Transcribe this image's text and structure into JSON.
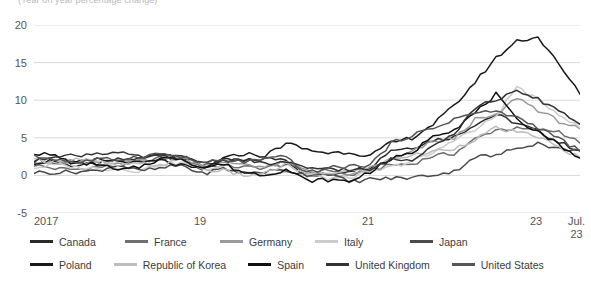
{
  "subtitle": "(Year on year percentage change)",
  "axes": {
    "yticks": [
      20,
      15,
      10,
      5,
      0,
      -5
    ],
    "ylim": [
      -5,
      20
    ],
    "xticks": [
      "2017",
      "19",
      "21",
      "23"
    ],
    "xtick_last_line1": "Jul.",
    "xtick_last_line2": "23"
  },
  "colors": {
    "canada": "#2b2b2b",
    "france": "#6e6e6e",
    "germany": "#9a9a9a",
    "italy": "#cccccc",
    "japan": "#4a4a4a",
    "poland": "#1a1a1a",
    "korea": "#bdbdbd",
    "spain": "#111111",
    "uk": "#333333",
    "us": "#555555",
    "gridline": "#d9d9d9",
    "text": "#3a3a3a",
    "subtitle": "#b9b9b9"
  },
  "chart_data": {
    "type": "line",
    "title": "",
    "subtitle": "(Year on year percentage change)",
    "xlabel": "",
    "ylabel": "",
    "ylim": [
      -5,
      20
    ],
    "grid": true,
    "legend_position": "bottom",
    "x": [
      "2017",
      "2017-04",
      "2017-07",
      "2017-10",
      "2018",
      "2018-04",
      "2018-07",
      "2018-10",
      "2019",
      "2019-04",
      "2019-07",
      "2019-10",
      "2020",
      "2020-04",
      "2020-07",
      "2020-10",
      "2021",
      "2021-04",
      "2021-07",
      "2021-10",
      "2022",
      "2022-04",
      "2022-07",
      "2022-10",
      "2023",
      "2023-04",
      "2023-07"
    ],
    "series": [
      {
        "name": "Canada",
        "color": "#2b2b2b",
        "values": [
          2.1,
          1.6,
          1.3,
          1.5,
          2.1,
          2.2,
          3.0,
          2.4,
          1.4,
          2.0,
          1.9,
          2.2,
          2.2,
          -0.2,
          0.1,
          0.7,
          1.1,
          3.4,
          3.7,
          4.7,
          5.1,
          6.8,
          8.1,
          6.9,
          5.9,
          4.4,
          3.3
        ]
      },
      {
        "name": "France",
        "color": "#6e6e6e",
        "values": [
          1.4,
          0.9,
          0.8,
          1.1,
          1.3,
          1.8,
          2.3,
          2.2,
          1.2,
          1.3,
          1.1,
          1.0,
          1.5,
          0.3,
          0.8,
          0.0,
          0.6,
          1.4,
          1.5,
          2.6,
          2.9,
          4.8,
          6.1,
          6.2,
          6.0,
          5.9,
          4.3
        ]
      },
      {
        "name": "Germany",
        "color": "#9a9a9a",
        "values": [
          1.9,
          1.7,
          1.6,
          1.6,
          1.4,
          2.1,
          2.1,
          2.3,
          1.5,
          1.6,
          1.6,
          1.1,
          1.7,
          0.8,
          0.0,
          -0.2,
          1.0,
          2.0,
          3.1,
          4.5,
          4.9,
          7.4,
          7.9,
          10.4,
          8.7,
          7.2,
          6.2
        ]
      },
      {
        "name": "Italy",
        "color": "#cccccc",
        "values": [
          1.0,
          1.4,
          1.1,
          0.9,
          0.9,
          0.6,
          1.5,
          1.6,
          0.9,
          1.0,
          0.4,
          0.2,
          0.5,
          0.0,
          -0.4,
          -0.3,
          0.4,
          1.1,
          1.9,
          2.9,
          4.8,
          6.0,
          7.9,
          11.8,
          10.0,
          8.2,
          6.3
        ]
      },
      {
        "name": "Japan",
        "color": "#4a4a4a",
        "values": [
          0.4,
          0.4,
          0.5,
          0.6,
          1.4,
          0.6,
          0.9,
          1.4,
          0.2,
          0.9,
          0.3,
          0.5,
          0.7,
          0.1,
          0.3,
          -0.9,
          -0.5,
          -0.4,
          -0.3,
          0.1,
          0.5,
          2.5,
          2.6,
          3.7,
          4.3,
          3.5,
          3.3
        ]
      },
      {
        "name": "Poland",
        "color": "#1a1a1a",
        "values": [
          1.7,
          2.0,
          1.7,
          2.1,
          1.9,
          1.6,
          2.0,
          1.3,
          0.7,
          2.2,
          2.9,
          2.6,
          4.3,
          3.4,
          3.0,
          3.1,
          2.6,
          4.3,
          5.0,
          6.8,
          9.2,
          12.4,
          15.6,
          17.9,
          18.4,
          14.7,
          10.8
        ]
      },
      {
        "name": "Republic of Korea",
        "color": "#bdbdbd",
        "values": [
          2.0,
          1.9,
          2.2,
          1.8,
          1.3,
          1.5,
          1.4,
          2.0,
          0.8,
          0.6,
          0.0,
          0.2,
          1.5,
          0.1,
          0.3,
          0.6,
          0.6,
          2.3,
          2.6,
          3.2,
          3.6,
          4.8,
          6.3,
          5.7,
          5.2,
          3.7,
          2.4
        ]
      },
      {
        "name": "Spain",
        "color": "#111111",
        "values": [
          3.0,
          2.6,
          1.5,
          1.6,
          0.6,
          1.1,
          2.2,
          2.3,
          1.0,
          1.5,
          0.4,
          0.1,
          0.8,
          -0.7,
          -0.6,
          -0.8,
          0.5,
          2.2,
          2.9,
          5.4,
          6.1,
          8.3,
          10.8,
          7.3,
          5.9,
          4.1,
          2.3
        ]
      },
      {
        "name": "United Kingdom",
        "color": "#333333",
        "values": [
          1.8,
          2.7,
          2.6,
          3.0,
          3.0,
          2.4,
          2.5,
          2.4,
          1.8,
          2.0,
          2.1,
          1.5,
          1.8,
          0.8,
          1.0,
          0.7,
          0.7,
          2.1,
          2.0,
          4.2,
          5.5,
          9.0,
          10.1,
          11.1,
          10.1,
          8.7,
          6.8
        ]
      },
      {
        "name": "United States",
        "color": "#555555",
        "values": [
          2.5,
          2.2,
          1.7,
          2.1,
          2.1,
          2.5,
          2.9,
          2.5,
          1.6,
          2.0,
          1.8,
          2.1,
          2.5,
          0.3,
          1.0,
          1.2,
          1.4,
          4.2,
          5.4,
          6.2,
          7.5,
          8.3,
          8.5,
          7.7,
          6.4,
          4.9,
          3.2
        ]
      }
    ]
  },
  "legend": {
    "row1": [
      {
        "label": "Canada",
        "color": "#2b2b2b"
      },
      {
        "label": "France",
        "color": "#6e6e6e"
      },
      {
        "label": "Germany",
        "color": "#9a9a9a"
      },
      {
        "label": "Italy",
        "color": "#cccccc"
      },
      {
        "label": "Japan",
        "color": "#4a4a4a"
      }
    ],
    "row2": [
      {
        "label": "Poland",
        "color": "#1a1a1a"
      },
      {
        "label": "Republic of Korea",
        "color": "#bdbdbd"
      },
      {
        "label": "Spain",
        "color": "#111111"
      },
      {
        "label": "United Kingdom",
        "color": "#333333"
      },
      {
        "label": "United States",
        "color": "#555555"
      }
    ]
  }
}
